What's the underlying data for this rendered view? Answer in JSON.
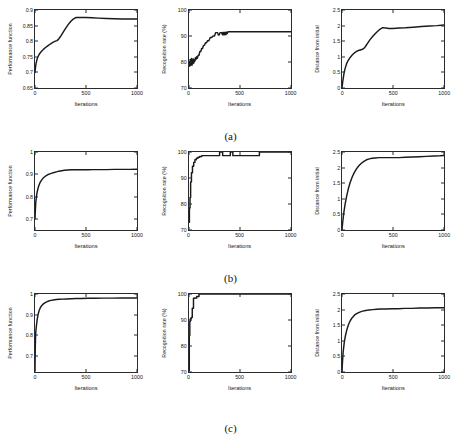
{
  "figure": {
    "row_labels": [
      "(a)",
      "(b)",
      "(c)"
    ],
    "background": "#ffffff",
    "curve_color": "#1a1a1a",
    "axis_color": "#2b2b2b"
  },
  "chart_data": [
    {
      "id": "a1",
      "type": "line",
      "title": "",
      "xlabel": "Iterations",
      "ylabel": "Performance function",
      "xlim": [
        0,
        1000
      ],
      "ylim": [
        0.65,
        0.9
      ],
      "xticks": [
        0,
        500,
        1000
      ],
      "xticklabels": [
        "0",
        "500",
        "1000"
      ],
      "yticks": [
        0.65,
        0.7,
        0.75,
        0.8,
        0.85,
        0.9
      ],
      "yticklabels": [
        "0.65",
        "0.7",
        "0.75",
        "0.8",
        "0.85",
        "0.9"
      ],
      "grid": false,
      "legend": "none",
      "x": [
        0,
        5,
        10,
        20,
        30,
        45,
        60,
        80,
        100,
        125,
        150,
        175,
        200,
        215,
        230,
        250,
        275,
        300,
        325,
        350,
        375,
        395,
        410,
        450,
        500,
        560,
        620,
        700,
        780,
        860,
        930,
        1000
      ],
      "y": [
        0.7,
        0.716,
        0.728,
        0.742,
        0.751,
        0.76,
        0.766,
        0.773,
        0.779,
        0.785,
        0.791,
        0.796,
        0.8,
        0.802,
        0.806,
        0.815,
        0.828,
        0.841,
        0.853,
        0.863,
        0.871,
        0.875,
        0.876,
        0.876,
        0.876,
        0.875,
        0.874,
        0.873,
        0.872,
        0.871,
        0.871,
        0.871
      ]
    },
    {
      "id": "a2",
      "type": "line",
      "title": "",
      "xlabel": "Iterations",
      "ylabel": "Recognition rate (%)",
      "xlim": [
        0,
        1000
      ],
      "ylim": [
        70,
        100
      ],
      "xticks": [
        0,
        500,
        1000
      ],
      "xticklabels": [
        "0",
        "500",
        "1000"
      ],
      "yticks": [
        70,
        80,
        90,
        100
      ],
      "yticklabels": [
        "70",
        "80",
        "90",
        "100"
      ],
      "grid": false,
      "legend": "none",
      "x": [
        0,
        3,
        6,
        9,
        12,
        15,
        18,
        22,
        26,
        30,
        34,
        38,
        42,
        46,
        50,
        56,
        62,
        68,
        75,
        82,
        90,
        98,
        106,
        115,
        124,
        133,
        142,
        152,
        162,
        172,
        182,
        195,
        208,
        222,
        236,
        250,
        262,
        272,
        280,
        288,
        296,
        304,
        312,
        320,
        328,
        334,
        340,
        346,
        352,
        358,
        364,
        370,
        376,
        382,
        390,
        400,
        420,
        500,
        600,
        700,
        800,
        900,
        1000
      ],
      "y": [
        79.0,
        78.4,
        80.2,
        79.2,
        81.0,
        78.6,
        80.4,
        79.0,
        81.4,
        78.8,
        80.0,
        79.4,
        81.2,
        79.6,
        80.8,
        80.2,
        81.6,
        80.9,
        82.0,
        81.4,
        82.6,
        82.6,
        84.0,
        84.0,
        85.2,
        85.2,
        86.4,
        86.4,
        87.4,
        87.4,
        88.2,
        88.2,
        89.4,
        89.4,
        90.0,
        90.0,
        91.3,
        91.3,
        91.3,
        90.4,
        90.4,
        91.3,
        91.3,
        91.3,
        90.5,
        91.4,
        90.5,
        91.4,
        90.5,
        91.4,
        90.6,
        91.5,
        91.0,
        91.6,
        91.6,
        91.6,
        91.6,
        91.6,
        91.6,
        91.6,
        91.6,
        91.6,
        91.6
      ]
    },
    {
      "id": "a3",
      "type": "line",
      "title": "",
      "xlabel": "Iterations",
      "ylabel": "Distance from initial",
      "xlim": [
        0,
        1000
      ],
      "ylim": [
        0,
        2.5
      ],
      "xticks": [
        0,
        500,
        1000
      ],
      "xticklabels": [
        "0",
        "500",
        "1000"
      ],
      "yticks": [
        0,
        0.5,
        1,
        1.5,
        2,
        2.5
      ],
      "yticklabels": [
        "0",
        "0.5",
        "1",
        "1.5",
        "2",
        "2.5"
      ],
      "grid": false,
      "legend": "none",
      "x": [
        0,
        8,
        18,
        30,
        45,
        60,
        80,
        100,
        120,
        140,
        160,
        180,
        200,
        215,
        230,
        250,
        275,
        300,
        325,
        350,
        375,
        395,
        410,
        430,
        460,
        500,
        560,
        620,
        700,
        780,
        860,
        930,
        1000
      ],
      "y": [
        0.02,
        0.22,
        0.44,
        0.62,
        0.78,
        0.88,
        0.98,
        1.06,
        1.12,
        1.17,
        1.2,
        1.22,
        1.24,
        1.27,
        1.33,
        1.43,
        1.55,
        1.65,
        1.74,
        1.82,
        1.89,
        1.93,
        1.93,
        1.92,
        1.91,
        1.91,
        1.92,
        1.93,
        1.95,
        1.97,
        1.99,
        2.0,
        2.02
      ]
    },
    {
      "id": "b1",
      "type": "line",
      "title": "",
      "xlabel": "Iterations",
      "ylabel": "Performance function",
      "xlim": [
        0,
        1000
      ],
      "ylim": [
        0.65,
        1.0
      ],
      "xticks": [
        0,
        500,
        1000
      ],
      "xticklabels": [
        "0",
        "500",
        "1000"
      ],
      "yticks": [
        0.7,
        0.8,
        0.9,
        1.0
      ],
      "yticklabels": [
        "0.7",
        "0.8",
        "0.9",
        "1"
      ],
      "grid": false,
      "legend": "none",
      "x": [
        0,
        4,
        8,
        14,
        20,
        28,
        36,
        46,
        56,
        68,
        80,
        95,
        110,
        128,
        146,
        166,
        188,
        210,
        235,
        260,
        290,
        320,
        355,
        390,
        430,
        470,
        520,
        570,
        630,
        700,
        780,
        860,
        930,
        1000
      ],
      "y": [
        0.7,
        0.742,
        0.775,
        0.8,
        0.818,
        0.834,
        0.847,
        0.859,
        0.868,
        0.876,
        0.883,
        0.889,
        0.894,
        0.899,
        0.902,
        0.905,
        0.908,
        0.911,
        0.914,
        0.916,
        0.918,
        0.919,
        0.92,
        0.92,
        0.92,
        0.92,
        0.92,
        0.921,
        0.921,
        0.921,
        0.922,
        0.922,
        0.922,
        0.923
      ]
    },
    {
      "id": "b2",
      "type": "line",
      "title": "",
      "xlabel": "Iterations",
      "ylabel": "Recognition rate (%)",
      "xlim": [
        0,
        1000
      ],
      "ylim": [
        70,
        100
      ],
      "xticks": [
        0,
        500,
        1000
      ],
      "xticklabels": [
        "0",
        "500",
        "1000"
      ],
      "yticks": [
        70,
        80,
        90,
        100
      ],
      "yticklabels": [
        "70",
        "80",
        "90",
        "100"
      ],
      "grid": false,
      "legend": "none",
      "x": [
        0,
        4,
        4,
        10,
        10,
        16,
        16,
        24,
        24,
        34,
        34,
        46,
        46,
        58,
        58,
        72,
        72,
        88,
        88,
        105,
        105,
        125,
        125,
        300,
        300,
        330,
        330,
        405,
        405,
        430,
        430,
        460,
        460,
        690,
        690,
        720,
        720,
        960,
        960,
        1000
      ],
      "y": [
        73.0,
        73.0,
        78.5,
        78.5,
        82.5,
        82.5,
        88.5,
        88.5,
        92.0,
        92.0,
        94.5,
        94.5,
        96.0,
        96.0,
        97.0,
        97.0,
        97.6,
        97.6,
        98.0,
        98.0,
        98.3,
        98.3,
        98.6,
        98.6,
        100.0,
        100.0,
        98.6,
        98.6,
        100.0,
        100.0,
        98.6,
        98.6,
        98.6,
        98.6,
        100.0,
        100.0,
        100.0,
        100.0,
        100.0,
        100.0
      ]
    },
    {
      "id": "b3",
      "type": "line",
      "title": "",
      "xlabel": "Iterations",
      "ylabel": "Distance from initial",
      "xlim": [
        0,
        1000
      ],
      "ylim": [
        0,
        2.5
      ],
      "xticks": [
        0,
        500,
        1000
      ],
      "xticklabels": [
        "0",
        "500",
        "1000"
      ],
      "yticks": [
        0,
        0.5,
        1,
        1.5,
        2,
        2.5
      ],
      "yticklabels": [
        "0",
        "0.5",
        "1",
        "1.5",
        "2",
        "2.5"
      ],
      "grid": false,
      "legend": "none",
      "x": [
        0,
        8,
        18,
        30,
        45,
        62,
        80,
        100,
        120,
        142,
        165,
        190,
        215,
        240,
        268,
        295,
        325,
        360,
        400,
        450,
        500,
        560,
        620,
        690,
        760,
        830,
        900,
        960,
        1000
      ],
      "y": [
        0.02,
        0.28,
        0.56,
        0.82,
        1.08,
        1.32,
        1.52,
        1.7,
        1.84,
        1.96,
        2.06,
        2.14,
        2.2,
        2.25,
        2.28,
        2.3,
        2.31,
        2.32,
        2.32,
        2.32,
        2.32,
        2.32,
        2.33,
        2.34,
        2.35,
        2.36,
        2.37,
        2.38,
        2.39
      ]
    },
    {
      "id": "c1",
      "type": "line",
      "title": "",
      "xlabel": "Iterations",
      "ylabel": "Performance function",
      "xlim": [
        0,
        1000
      ],
      "ylim": [
        0.62,
        1.0
      ],
      "xticks": [
        0,
        500,
        1000
      ],
      "xticklabels": [
        "0",
        "500",
        "1000"
      ],
      "yticks": [
        0.7,
        0.8,
        0.9,
        1.0
      ],
      "yticklabels": [
        "0.7",
        "0.8",
        "0.9",
        "1"
      ],
      "grid": false,
      "legend": "none",
      "x": [
        0,
        3,
        6,
        10,
        15,
        22,
        30,
        40,
        52,
        65,
        80,
        96,
        114,
        134,
        156,
        180,
        208,
        238,
        272,
        310,
        355,
        405,
        460,
        520,
        590,
        670,
        760,
        850,
        930,
        1000
      ],
      "y": [
        0.628,
        0.745,
        0.8,
        0.828,
        0.85,
        0.878,
        0.9,
        0.918,
        0.933,
        0.943,
        0.951,
        0.957,
        0.962,
        0.966,
        0.969,
        0.971,
        0.973,
        0.974,
        0.975,
        0.976,
        0.977,
        0.978,
        0.978,
        0.979,
        0.979,
        0.98,
        0.98,
        0.981,
        0.981,
        0.981
      ]
    },
    {
      "id": "c2",
      "type": "line",
      "title": "",
      "xlabel": "Iterations",
      "ylabel": "Recognition rate (%)",
      "xlim": [
        0,
        1000
      ],
      "ylim": [
        70,
        100
      ],
      "xticks": [
        0,
        500,
        1000
      ],
      "xticklabels": [
        "0",
        "500",
        "1000"
      ],
      "yticks": [
        70,
        80,
        90,
        100
      ],
      "yticklabels": [
        "70",
        "80",
        "90",
        "100"
      ],
      "grid": false,
      "legend": "none",
      "x": [
        0,
        3,
        3,
        8,
        8,
        14,
        14,
        22,
        22,
        32,
        32,
        44,
        44,
        58,
        58,
        76,
        76,
        98,
        98,
        118,
        118,
        1000
      ],
      "y": [
        70.5,
        70.5,
        84.0,
        84.0,
        89.5,
        89.5,
        90.5,
        90.5,
        91.0,
        91.0,
        94.5,
        94.5,
        98.4,
        98.4,
        98.5,
        98.5,
        99.0,
        99.0,
        100.0,
        100.0,
        100.0,
        100.0
      ]
    },
    {
      "id": "c3",
      "type": "line",
      "title": "",
      "xlabel": "Iterations",
      "ylabel": "Distance from initial",
      "xlim": [
        0,
        1000
      ],
      "ylim": [
        0,
        2.5
      ],
      "xticks": [
        0,
        500,
        1000
      ],
      "xticklabels": [
        "0",
        "500",
        "1000"
      ],
      "yticks": [
        0,
        0.5,
        1,
        1.5,
        2,
        2.5
      ],
      "yticklabels": [
        "0",
        "0.5",
        "1",
        "1.5",
        "2",
        "2.5"
      ],
      "grid": false,
      "legend": "none",
      "x": [
        0,
        5,
        12,
        22,
        34,
        48,
        64,
        82,
        102,
        124,
        148,
        174,
        202,
        232,
        265,
        300,
        340,
        385,
        435,
        490,
        550,
        615,
        685,
        760,
        840,
        920,
        1000
      ],
      "y": [
        0.02,
        0.34,
        0.66,
        0.94,
        1.17,
        1.36,
        1.52,
        1.65,
        1.75,
        1.83,
        1.88,
        1.92,
        1.95,
        1.97,
        1.99,
        2.0,
        2.01,
        2.02,
        2.02,
        2.03,
        2.03,
        2.04,
        2.04,
        2.05,
        2.05,
        2.06,
        2.06
      ]
    }
  ]
}
